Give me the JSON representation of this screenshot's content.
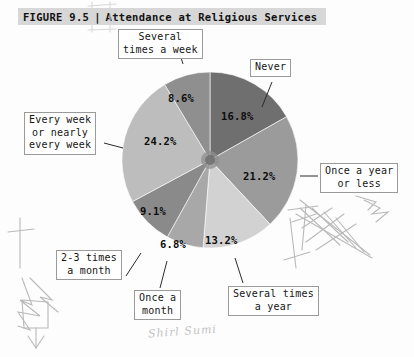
{
  "figure": {
    "label": "FIGURE 9.5",
    "separator": "|",
    "title": "Attendance at Religious Services"
  },
  "chart_data": {
    "type": "pie",
    "title": "Attendance at Religious Services",
    "categories": [
      "Never",
      "Once a year or less",
      "Several times a year",
      "Once a month",
      "2-3 times a month",
      "Every week or nearly every week",
      "Several times a week"
    ],
    "values": [
      16.8,
      21.2,
      13.2,
      6.8,
      9.1,
      24.2,
      8.6
    ],
    "value_labels": [
      "16.8%",
      "21.2%",
      "13.2%",
      "6.8%",
      "9.1%",
      "24.2%",
      "8.6%"
    ],
    "colors": [
      "#6f6f6f",
      "#9b9b9b",
      "#d2d2d2",
      "#a8a8a8",
      "#8a8a8a",
      "#bdbdbd",
      "#8f8f8f"
    ],
    "units": "percent",
    "legend": "none",
    "labels_position": "callout-boxes-with-leader-lines"
  },
  "callouts": {
    "several_times_a_week": {
      "line1": "Several",
      "line2": "times a week"
    },
    "never": {
      "line1": "Never"
    },
    "once_a_year_or_less": {
      "line1": "Once a year",
      "line2": "or less"
    },
    "several_times_a_year": {
      "line1": "Several times",
      "line2": "a year"
    },
    "once_a_month": {
      "line1": "Once a",
      "line2": "month"
    },
    "two_three_times_a_month": {
      "line1": "2-3 times",
      "line2": "a month"
    },
    "every_week": {
      "line1": "Every week",
      "line2": "or nearly",
      "line3": "every week"
    }
  },
  "annotations": {
    "handwriting": "Shirl Sumi"
  }
}
